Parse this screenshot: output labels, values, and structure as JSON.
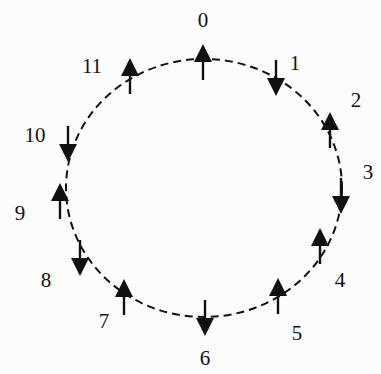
{
  "diagram": {
    "type": "spin-ring",
    "circle": {
      "cx": 204,
      "cy": 188,
      "rx": 138,
      "ry": 129,
      "stroke": "#111111",
      "dashed": true
    },
    "colors": {
      "ink": "#111111",
      "background": "#fcfcfc"
    },
    "sites": [
      {
        "label": "0",
        "spin": "up",
        "x": 203,
        "y": 62,
        "lx": 203,
        "ly": 27
      },
      {
        "label": "1",
        "spin": "down",
        "x": 276,
        "y": 78,
        "lx": 295,
        "ly": 70
      },
      {
        "label": "2",
        "spin": "up",
        "x": 330,
        "y": 130,
        "lx": 356,
        "ly": 107
      },
      {
        "label": "3",
        "spin": "down",
        "x": 341,
        "y": 196,
        "lx": 368,
        "ly": 179
      },
      {
        "label": "4",
        "spin": "up",
        "x": 320,
        "y": 246,
        "lx": 340,
        "ly": 287
      },
      {
        "label": "5",
        "spin": "up",
        "x": 278,
        "y": 296,
        "lx": 297,
        "ly": 340
      },
      {
        "label": "6",
        "spin": "down",
        "x": 205,
        "y": 318,
        "lx": 205,
        "ly": 365
      },
      {
        "label": "7",
        "spin": "up",
        "x": 124,
        "y": 297,
        "lx": 104,
        "ly": 328
      },
      {
        "label": "8",
        "spin": "down",
        "x": 80,
        "y": 258,
        "lx": 46,
        "ly": 287
      },
      {
        "label": "9",
        "spin": "up",
        "x": 60,
        "y": 201,
        "lx": 20,
        "ly": 220
      },
      {
        "label": "10",
        "spin": "down",
        "x": 68,
        "y": 144,
        "lx": 35,
        "ly": 142
      },
      {
        "label": "11",
        "spin": "up",
        "x": 130,
        "y": 76,
        "lx": 92,
        "ly": 73
      }
    ]
  }
}
